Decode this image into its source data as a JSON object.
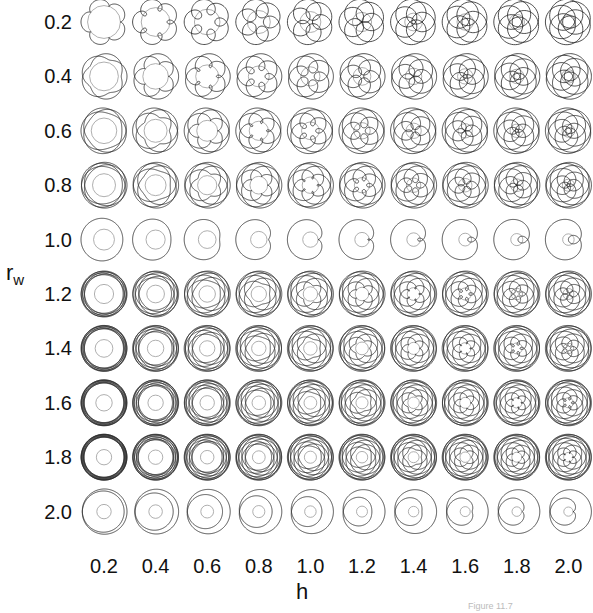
{
  "figure": {
    "y_axis_title": "r",
    "y_axis_subscript": "w",
    "x_axis_title": "h",
    "footer_text": "Figure 11.7"
  },
  "chart_data": {
    "type": "table",
    "title": "",
    "xlabel": "h",
    "ylabel": "r_w",
    "x": [
      0.2,
      0.4,
      0.6,
      0.8,
      1.0,
      1.2,
      1.4,
      1.6,
      1.8,
      2.0
    ],
    "y": [
      0.2,
      0.4,
      0.6,
      0.8,
      1.0,
      1.2,
      1.4,
      1.6,
      1.8,
      2.0
    ],
    "x_tick_labels": [
      "0.2",
      "0.4",
      "0.6",
      "0.8",
      "1.0",
      "1.2",
      "1.4",
      "1.6",
      "1.8",
      "2.0"
    ],
    "y_tick_labels": [
      "0.2",
      "0.4",
      "0.6",
      "0.8",
      "1.0",
      "1.2",
      "1.4",
      "1.6",
      "1.8",
      "2.0"
    ],
    "curve_color": "#222222",
    "fixed_circle_color": "#9a9a9a",
    "grid": false,
    "legend": false
  },
  "layout": {
    "col_x0": 104,
    "col_dx": 51.6,
    "row_y0": 22,
    "row_dy": 54.4,
    "cell_radius": 23
  }
}
